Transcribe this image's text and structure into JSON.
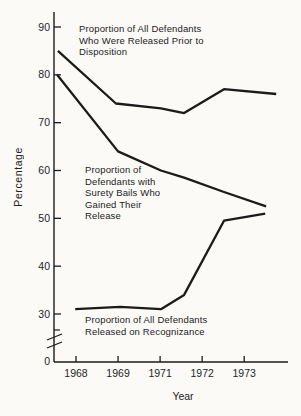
{
  "figure": {
    "paper_color": "#fbfaf7",
    "ink_color": "#1b1b1b"
  },
  "chart_data": {
    "type": "line",
    "title": "",
    "xlabel": "Year",
    "ylabel": "Percentage",
    "x_tick_labels": [
      "1968",
      "1969",
      "1971",
      "1972",
      "1973"
    ],
    "y_tick_labels": [
      "90",
      "80",
      "70",
      "60",
      "50",
      "40",
      "30"
    ],
    "y_tick_values": [
      90,
      80,
      70,
      60,
      50,
      40,
      30
    ],
    "y_origin_label": "0",
    "y_axis_break": true,
    "ylim_shown": [
      30,
      90
    ],
    "grid": false,
    "legend": "inline-annotations",
    "series": [
      {
        "name": "Proportion of All Defendants Who Were Released Prior to Disposition",
        "annotation": "Proportion of All Defendants\nWho Were Released Prior to\nDisposition",
        "years_approx": [
          1968,
          1969,
          1971,
          1971.5,
          1972.5,
          1973.5
        ],
        "values": [
          85,
          74,
          73,
          72,
          77,
          76
        ],
        "axis_pos": [
          -0.43,
          0.95,
          2.02,
          2.57,
          3.52,
          4.76
        ]
      },
      {
        "name": "Proportion of Defendants with Surety Bails Who Gained Their Release",
        "annotation": "Proportion of\nDefendants with\nSurety Bails Who\nGained Their\nRelease",
        "years_approx": [
          1968,
          1969,
          1971,
          1971.5,
          1972.5,
          1973.5
        ],
        "values": [
          80,
          64,
          60,
          58.5,
          55.5,
          52.5
        ],
        "axis_pos": [
          -0.45,
          1.0,
          2.02,
          2.57,
          3.52,
          4.52
        ]
      },
      {
        "name": "Proportion of All Defendants Released on Recognizance",
        "annotation": "Proportion of All Defendants\nReleased on Recognizance",
        "years_approx": [
          1968,
          1969,
          1971,
          1971.5,
          1972.5,
          1973.5
        ],
        "values": [
          31,
          31.5,
          31,
          34,
          49.5,
          51
        ],
        "axis_pos": [
          -0.02,
          1.05,
          2.02,
          2.57,
          3.52,
          4.5
        ]
      }
    ]
  }
}
